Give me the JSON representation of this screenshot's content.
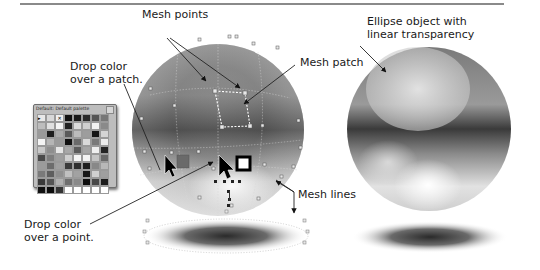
{
  "annotations": {
    "mesh_points": "Mesh points",
    "ellipse_object": "Ellipse object with\nlinear transparency",
    "mesh_patch": "Mesh patch",
    "drop_patch": "Drop color\nover a patch.",
    "drop_point": "Drop color\nover a point.",
    "mesh_lines": "Mesh lines"
  },
  "palette": {
    "title": "Default: Default palette",
    "close_icon": "close-icon",
    "swatches": [
      "#e8e8e8",
      "#d8d8d8",
      "#f0f0f0",
      "#111111",
      "#1a1a1a",
      "#2a2a2a",
      "#555555",
      "#777777",
      "#bdbdbd",
      "#e0e0e0",
      "#f5f5f5",
      "#222222",
      "#dcdcdc",
      "#cfcfcf",
      "#f2f2f2",
      "#8a8a8a",
      "#9a9a9a",
      "#1d1d1d",
      "#aaaaaa",
      "#5a5a5a",
      "#bbbbbb",
      "#9d9d9d",
      "#141414",
      "#d5d5d5",
      "#f4f4f4",
      "#b5b5b5",
      "#9a9a9a",
      "#0f0f0f",
      "#6a6a6a",
      "#d9d9d9",
      "#7a7a7a",
      "#ececec",
      "#c8c8c8",
      "#8e8e8e",
      "#e6e6e6",
      "#a8a8a8",
      "#5c5c5c",
      "#a5a5a5",
      "#efefef",
      "#232323",
      "#4a4a4a",
      "#7e7e7e",
      "#9e9e9e",
      "#cfcfcf",
      "#f6f6f6",
      "#f3f3f3",
      "#c4c4c4",
      "#686868",
      "#9b9b9b",
      "#6d6d6d",
      "#a0a0a0",
      "#3a3a3a",
      "#2e2e2e",
      "#1e1e1e",
      "#888888",
      "#b8b8b8",
      "#7a7a7a",
      "#5e5e5e",
      "#8f8f8f",
      "#c0c0c0",
      "#a2a2a2",
      "#161616",
      "#d0d0d0",
      "#9f9f9f",
      "#3b3b3b",
      "#555555",
      "#b1b1b1",
      "#6f6f6f",
      "#8a8a8a",
      "#0e0e0e",
      "#484848",
      "#1c1c1c",
      "#111111",
      "#0d0d0d",
      "#333333",
      "#ffffff",
      "#ffffff",
      "#ffffff",
      "#ffffff",
      "#ffffff"
    ]
  },
  "colors": {
    "rule": "#8a8a8a",
    "mesh_dot": "#e6e6e6",
    "patch_outline": "#ffffff",
    "dropped_patch_color": "#6a6a6a"
  }
}
